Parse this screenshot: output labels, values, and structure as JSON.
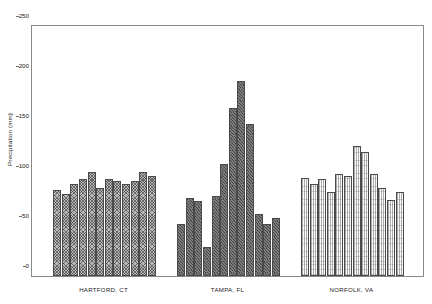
{
  "chart_data": {
    "type": "bar",
    "title": "",
    "xlabel": "",
    "ylabel": "Precipitation (mm)",
    "ylim": [
      0,
      250
    ],
    "yticks": [
      0,
      50,
      100,
      150,
      200,
      250
    ],
    "ytick_labels": [
      "0",
      "50",
      "100",
      "150",
      "200",
      "250"
    ],
    "grid": false,
    "legend_position": "none",
    "groups": [
      {
        "name": "HARTFORD, CT",
        "label": "HARTFORD, CT",
        "fill": "hartford",
        "color": "#b9b9b9",
        "categories": [
          "1",
          "2",
          "3",
          "4",
          "5",
          "6",
          "7",
          "8",
          "9",
          "10",
          "11",
          "12"
        ],
        "values": [
          86,
          82,
          92,
          97,
          104,
          88,
          97,
          95,
          92,
          95,
          104,
          100
        ]
      },
      {
        "name": "TAMPA, FL",
        "label": "TAMPA, FL",
        "fill": "tampa",
        "color": "#7d7d7d",
        "categories": [
          "1",
          "2",
          "3",
          "4",
          "5",
          "6",
          "7",
          "8",
          "9",
          "10",
          "11",
          "12"
        ],
        "values": [
          52,
          78,
          75,
          29,
          80,
          112,
          168,
          195,
          152,
          62,
          52,
          58
        ]
      },
      {
        "name": "NORFOLK, VA",
        "label": "NORFOLK, VA",
        "fill": "norfolk",
        "color": "#fbfbfb",
        "categories": [
          "1",
          "2",
          "3",
          "4",
          "5",
          "6",
          "7",
          "8",
          "9",
          "10",
          "11",
          "12"
        ],
        "values": [
          98,
          92,
          97,
          84,
          102,
          100,
          130,
          124,
          102,
          88,
          76,
          84
        ]
      }
    ]
  },
  "axes": {
    "y_title": "Precipitation (mm)"
  }
}
